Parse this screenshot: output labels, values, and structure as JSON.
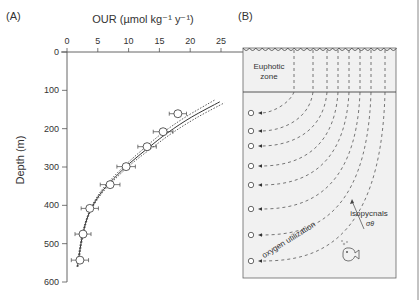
{
  "chart_data": {
    "type": "scatter",
    "panel_label": "(A)",
    "title": "",
    "xlabel": "OUR (µmol kg⁻¹ y⁻¹)",
    "ylabel": "Depth (m)",
    "xlim": [
      0,
      25
    ],
    "ylim": [
      0,
      600
    ],
    "y_inverted": true,
    "x_axis_position": "top",
    "xticks": [
      0,
      5,
      10,
      15,
      20,
      25
    ],
    "yticks": [
      0,
      100,
      200,
      300,
      400,
      500,
      600
    ],
    "grid": false,
    "series": [
      {
        "name": "observations",
        "marker": "open-circle",
        "points": [
          {
            "our": 18.0,
            "depth": 161,
            "err": 1.4
          },
          {
            "our": 15.6,
            "depth": 208,
            "err": 1.6
          },
          {
            "our": 13.0,
            "depth": 247,
            "err": 1.5
          },
          {
            "our": 9.6,
            "depth": 299,
            "err": 1.5
          },
          {
            "our": 7.0,
            "depth": 346,
            "err": 1.6
          },
          {
            "our": 3.7,
            "depth": 408,
            "err": 1.4
          },
          {
            "our": 2.6,
            "depth": 475,
            "err": 1.3
          },
          {
            "our": 2.1,
            "depth": 543,
            "err": 1.4
          }
        ]
      },
      {
        "name": "fit",
        "line": "solid",
        "points": [
          [
            1.7,
            560
          ],
          [
            2.5,
            480
          ],
          [
            3.6,
            420
          ],
          [
            5.4,
            370
          ],
          [
            7.6,
            330
          ],
          [
            10.2,
            290
          ],
          [
            13.2,
            250
          ],
          [
            16.4,
            210
          ],
          [
            20.2,
            170
          ],
          [
            24.8,
            130
          ]
        ]
      },
      {
        "name": "fit-upper",
        "line": "dotted",
        "points": [
          [
            1.8,
            560
          ],
          [
            2.6,
            480
          ],
          [
            3.7,
            420
          ],
          [
            5.6,
            370
          ],
          [
            7.9,
            330
          ],
          [
            10.6,
            290
          ],
          [
            13.8,
            250
          ],
          [
            17.2,
            210
          ],
          [
            21.2,
            170
          ],
          [
            25.5,
            133
          ]
        ]
      },
      {
        "name": "fit-lower",
        "line": "dotted",
        "points": [
          [
            1.6,
            560
          ],
          [
            2.4,
            480
          ],
          [
            3.5,
            420
          ],
          [
            5.2,
            370
          ],
          [
            7.3,
            330
          ],
          [
            9.8,
            290
          ],
          [
            12.6,
            250
          ],
          [
            15.6,
            210
          ],
          [
            19.2,
            170
          ],
          [
            24.0,
            125
          ]
        ]
      }
    ]
  },
  "diagram": {
    "panel_label": "(B)",
    "euphotic_label_line1": "Euphotic",
    "euphotic_label_line2": "zone",
    "isopycnals_label": "isopycnals",
    "sigma_label": "σθ",
    "oxygen_label": "oxygen utilization",
    "sample_count": 8,
    "colors": {
      "box_fill": "#f1f1f1",
      "line": "#444444"
    }
  }
}
